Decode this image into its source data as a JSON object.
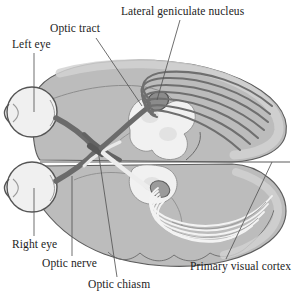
{
  "figure": {
    "type": "anatomical-diagram",
    "view": "horizontal (axial) section of the human brain with both eyes",
    "background_color": "#ffffff",
    "labels": [
      {
        "id": "left-eye",
        "text": "Left eye",
        "x": 12,
        "y": 39
      },
      {
        "id": "optic-tract",
        "text": "Optic tract",
        "x": 50,
        "y": 23
      },
      {
        "id": "lgn",
        "text": "Lateral geniculate nucleus",
        "x": 121,
        "y": 6
      },
      {
        "id": "right-eye",
        "text": "Right eye",
        "x": 12,
        "y": 239
      },
      {
        "id": "optic-nerve",
        "text": "Optic nerve",
        "x": 42,
        "y": 258
      },
      {
        "id": "chiasm",
        "text": "Optic chiasm",
        "x": 88,
        "y": 279
      },
      {
        "id": "v1",
        "text": "Primary visual cortex",
        "x": 190,
        "y": 261
      }
    ],
    "colors": {
      "background": "#ffffff",
      "brain_fill": "#b9b9b9",
      "brain_fill_light": "#c6c6c6",
      "brain_outline": "#5a5a5a",
      "cortex_band": "#a8a8a8",
      "eye_fill": "#efefef",
      "eye_outline": "#555555",
      "nerve_dark": "#6e6e6e",
      "nerve_darker": "#4f4f4f",
      "lgn_fill": "#8a8a8a",
      "thalamus_fill": "#f2f2f2",
      "radiation_light": "#f4f4f4",
      "leader_line": "#555555",
      "text": "#1d1d1d"
    },
    "structures": [
      {
        "name": "left-eye",
        "description": "left eyeball, upper-left"
      },
      {
        "name": "right-eye",
        "description": "right eyeball, lower-left"
      },
      {
        "name": "optic-nerve-left",
        "description": "dark nerve from left eye to chiasm"
      },
      {
        "name": "optic-nerve-right",
        "description": "dark nerve from right eye to chiasm"
      },
      {
        "name": "optic-chiasm",
        "description": "X-shaped crossing of the two optic nerves"
      },
      {
        "name": "optic-tract",
        "description": "nerve bundle from chiasm to lateral geniculate nucleus"
      },
      {
        "name": "lateral-geniculate-nucleus",
        "description": "dark relay knob on the thalamus"
      },
      {
        "name": "thalamus-brainstem",
        "description": "pale central mass of the section"
      },
      {
        "name": "optic-radiation-upper",
        "description": "dark fanning fibers to the upper occipital cortex"
      },
      {
        "name": "optic-radiation-lower",
        "description": "pale fanning fibers to the lower occipital cortex"
      },
      {
        "name": "primary-visual-cortex",
        "description": "occipital cortex at the posterior (right) pole"
      }
    ]
  }
}
